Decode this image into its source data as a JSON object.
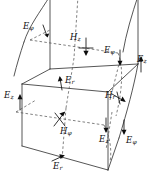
{
  "figure": {
    "background_color": "#ffffff",
    "line_color": "#2b2b2b",
    "hidden_line_color": "#4a4a4a",
    "arrow_color": "#0d0d0d"
  },
  "labels": {
    "e_phi_top_left": {
      "symbol": "E",
      "subscript": "φ"
    },
    "h_z_top_center": {
      "symbol": "H",
      "subscript": "z"
    },
    "e_phi_top_right": {
      "symbol": "E",
      "subscript": "φ"
    },
    "e_z_right_upper": {
      "symbol": "E",
      "subscript": "z"
    },
    "e_r_center": {
      "symbol": "E",
      "subscript": "r"
    },
    "e_z_left": {
      "symbol": "E",
      "subscript": "z"
    },
    "h_r_right": {
      "symbol": "H",
      "subscript": "r"
    },
    "h_phi_bottom_center": {
      "symbol": "H",
      "subscript": "φ"
    },
    "e_z_bottom_right": {
      "symbol": "E",
      "subscript": "z"
    },
    "e_phi_bottom_right": {
      "symbol": "E",
      "subscript": "φ"
    },
    "e_r_bottom": {
      "symbol": "E",
      "subscript": "r"
    }
  }
}
